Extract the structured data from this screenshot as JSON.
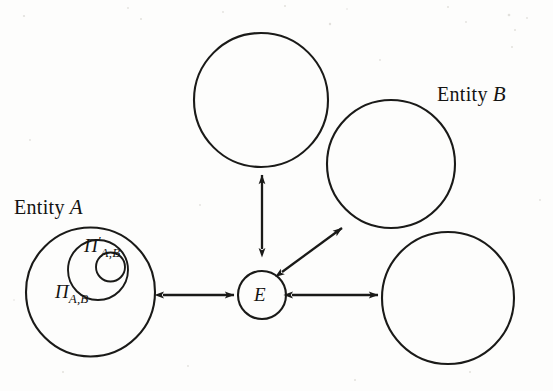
{
  "figure": {
    "background_color": "#fdfdfc",
    "ink_color": "#1a1a18",
    "width": 553,
    "height": 391
  },
  "labels": {
    "entity_a_text": "Entity",
    "entity_a_var": "A",
    "entity_b_text": "Entity",
    "entity_b_var": "B",
    "center_node": "E",
    "pi_outer_symbol": "Π",
    "pi_outer_subscript": "A,B",
    "pi_inner_symbol": "Π",
    "pi_inner_prime": "′",
    "pi_inner_subscript": "A,B"
  },
  "nodes": [
    {
      "name": "entity-a-outer-circle",
      "label": "Π A,B",
      "cx": 90.5,
      "cy": 292,
      "r": 64.5,
      "role": "outer-session-set"
    },
    {
      "name": "entity-a-middle-circle",
      "label": "Π′ A,B",
      "cx": 98,
      "cy": 270,
      "r": 30,
      "role": "middle-session-set"
    },
    {
      "name": "entity-a-inner-circle",
      "label": "",
      "cx": 110.5,
      "cy": 267,
      "r": 14.5,
      "role": "inner-session-set"
    },
    {
      "name": "top-circle",
      "label": "",
      "cx": 261,
      "cy": 100,
      "r": 67,
      "role": "peer-entity"
    },
    {
      "name": "entity-b-upper-circle",
      "label": "Entity B",
      "cx": 391,
      "cy": 164,
      "r": 64,
      "role": "peer-entity"
    },
    {
      "name": "entity-b-lower-circle",
      "label": "",
      "cx": 448,
      "cy": 298,
      "r": 66,
      "role": "peer-entity"
    },
    {
      "name": "center-node-circle",
      "label": "E",
      "cx": 262,
      "cy": 295,
      "r": 24,
      "role": "hub"
    }
  ],
  "connections": [
    {
      "name": "arrow-entity-a-to-center",
      "from": "entity-a-outer-circle",
      "to": "center-node-circle",
      "style": "double-headed",
      "x1": 163,
      "y1": 295,
      "x2": 234,
      "y2": 295
    },
    {
      "name": "arrow-center-to-top-circle",
      "from": "center-node-circle",
      "to": "top-circle",
      "style": "double-headed",
      "x1": 262,
      "y1": 249,
      "x2": 262,
      "y2": 175
    },
    {
      "name": "arrow-center-to-entity-b-upper",
      "from": "center-node-circle",
      "to": "entity-b-upper-circle",
      "style": "double-headed",
      "x1": 282,
      "y1": 272,
      "x2": 342,
      "y2": 228
    },
    {
      "name": "arrow-center-to-entity-b-lower",
      "from": "center-node-circle",
      "to": "entity-b-lower-circle",
      "style": "double-headed",
      "x1": 292,
      "y1": 295,
      "x2": 378,
      "y2": 295
    }
  ]
}
